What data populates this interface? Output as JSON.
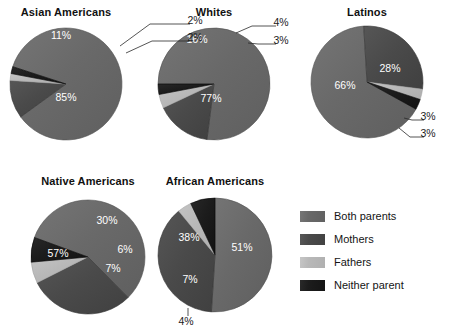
{
  "legend": {
    "position": "bottom-right",
    "items": [
      {
        "label": "Both parents",
        "color": "#696969"
      },
      {
        "label": "Mothers",
        "color": "#4a4a4a"
      },
      {
        "label": "Fathers",
        "color": "#b8b8b8"
      },
      {
        "label": "Neither parent",
        "color": "#1c1c1c"
      }
    ]
  },
  "chart_data": {
    "type": "pie",
    "title": "",
    "series_labels": [
      "Both parents",
      "Mothers",
      "Fathers",
      "Neither parent"
    ],
    "colors": [
      "#696969",
      "#4a4a4a",
      "#b8b8b8",
      "#1c1c1c"
    ],
    "unit": "%",
    "charts": [
      {
        "title": "Asian Americans",
        "categories": [
          "Both parents",
          "Mothers",
          "Fathers",
          "Neither parent"
        ],
        "values": [
          85,
          11,
          2,
          2
        ],
        "labels": [
          "85%",
          "11%",
          "2%",
          "2%"
        ]
      },
      {
        "title": "Whites",
        "categories": [
          "Both parents",
          "Mothers",
          "Fathers",
          "Neither parent"
        ],
        "values": [
          77,
          16,
          4,
          3
        ],
        "labels": [
          "77%",
          "16%",
          "4%",
          "3%"
        ]
      },
      {
        "title": "Latinos",
        "categories": [
          "Both parents",
          "Mothers",
          "Fathers",
          "Neither parent"
        ],
        "values": [
          66,
          28,
          3,
          3
        ],
        "labels": [
          "66%",
          "28%",
          "3%",
          "3%"
        ]
      },
      {
        "title": "Native Americans",
        "categories": [
          "Both parents",
          "Mothers",
          "Fathers",
          "Neither parent"
        ],
        "values": [
          57,
          30,
          6,
          7
        ],
        "labels": [
          "57%",
          "30%",
          "6%",
          "7%"
        ]
      },
      {
        "title": "African Americans",
        "categories": [
          "Both parents",
          "Mothers",
          "Fathers",
          "Neither parent"
        ],
        "values": [
          51,
          38,
          4,
          7
        ],
        "labels": [
          "51%",
          "38%",
          "4%",
          "7%"
        ]
      }
    ]
  },
  "layout": {
    "pies": [
      {
        "cx": 66,
        "cy": 84,
        "r": 56,
        "title_x": 66,
        "title_y": 6,
        "rotate": -72
      },
      {
        "cx": 214,
        "cy": 84,
        "r": 56,
        "title_x": 214,
        "title_y": 6,
        "rotate": -90
      },
      {
        "cx": 367,
        "cy": 82,
        "r": 56,
        "title_x": 367,
        "title_y": 6,
        "rotate": 119
      },
      {
        "cx": 88,
        "cy": 257,
        "r": 57,
        "title_x": 88,
        "title_y": 175,
        "rotate": -70
      },
      {
        "cx": 215,
        "cy": 255,
        "r": 57,
        "title_x": 215,
        "title_y": 175,
        "rotate": 0
      }
    ],
    "callouts": [
      {
        "pie": 0,
        "text": "2%",
        "tx": 195,
        "ty": 21,
        "path": "M 120 46 L 150 24 L 190 24"
      },
      {
        "pie": 0,
        "text": "2%",
        "tx": 195,
        "ty": 38,
        "path": "M 126 53 L 152 41 L 190 41"
      },
      {
        "pie": 1,
        "text": "4%",
        "tx": 281,
        "ty": 23,
        "path": "M 236 33 L 252 26 L 276 26"
      },
      {
        "pie": 1,
        "text": "3%",
        "tx": 281,
        "ty": 41,
        "path": "M 248 43 L 258 44 L 276 44"
      },
      {
        "pie": 2,
        "text": "3%",
        "tx": 428,
        "ty": 117,
        "path": "M 404 118 L 412 120 L 424 120"
      },
      {
        "pie": 2,
        "text": "3%",
        "tx": 428,
        "ty": 134,
        "path": "M 399 128 L 410 137 L 424 137"
      },
      {
        "pie": 4,
        "text": "4%",
        "tx": 186,
        "ty": 322,
        "path": "M 188 308 L 188 316"
      }
    ],
    "inside_labels": [
      {
        "pie": 0,
        "text": "85%",
        "x": 66,
        "y": 101
      },
      {
        "pie": 0,
        "text": "11%",
        "x": 61,
        "y": 39
      },
      {
        "pie": 1,
        "text": "77%",
        "x": 211,
        "y": 102
      },
      {
        "pie": 1,
        "text": "16%",
        "x": 197,
        "y": 43
      },
      {
        "pie": 2,
        "text": "66%",
        "x": 345,
        "y": 89
      },
      {
        "pie": 2,
        "text": "28%",
        "x": 390,
        "y": 72
      },
      {
        "pie": 3,
        "text": "57%",
        "x": 58,
        "y": 257
      },
      {
        "pie": 3,
        "text": "30%",
        "x": 107,
        "y": 224
      },
      {
        "pie": 3,
        "text": "6%",
        "x": 125,
        "y": 253
      },
      {
        "pie": 3,
        "text": "7%",
        "x": 113,
        "y": 272
      },
      {
        "pie": 4,
        "text": "51%",
        "x": 242,
        "y": 251
      },
      {
        "pie": 4,
        "text": "38%",
        "x": 189,
        "y": 241
      },
      {
        "pie": 4,
        "text": "7%",
        "x": 190,
        "y": 283
      }
    ]
  }
}
